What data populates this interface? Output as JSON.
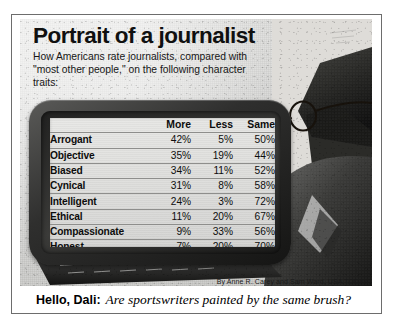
{
  "graphic": {
    "title": "Portrait of a journalist",
    "subtitle": "How Americans rate journalists, compared with \"most other people,\" on the following character traits:",
    "source": "Source: Louis Harris for the Center for Media and Public Affairs",
    "byline": "By Anne R. Carey and Sam Ward, USA TODAY"
  },
  "caption": {
    "lead": "Hello, Dali:",
    "text": "Are sportswriters painted by the same brush?"
  },
  "colors": {
    "panel_background": "#d9d9d7",
    "screen_background": "#dedede",
    "bezel_dark": "#151514",
    "text": "#0d0d0d",
    "rule": "#8e8e8c",
    "frame_border": "#6d6d6d"
  },
  "illustration": {
    "subject": "silhouette of a man in a suit wearing eyeglasses behind a computer monitor and keyboard",
    "parts": [
      "head-silhouette",
      "eyeglasses-lens",
      "eyeglasses-temple",
      "suit-shoulder",
      "keyboard"
    ]
  },
  "chart_data": {
    "type": "table",
    "title": "Portrait of a journalist",
    "subtitle": "How Americans rate journalists, compared with \"most other people,\" on the following character traits:",
    "columns": [
      "",
      "More",
      "Less",
      "Same"
    ],
    "categories": [
      "Arrogant",
      "Objective",
      "Biased",
      "Cynical",
      "Intelligent",
      "Ethical",
      "Compassionate",
      "Honest"
    ],
    "series": [
      {
        "name": "More",
        "values": [
          42,
          35,
          34,
          31,
          24,
          11,
          9,
          7
        ],
        "unit": "%"
      },
      {
        "name": "Less",
        "values": [
          5,
          19,
          11,
          8,
          3,
          20,
          33,
          20
        ],
        "unit": "%"
      },
      {
        "name": "Same",
        "values": [
          50,
          44,
          52,
          58,
          72,
          67,
          56,
          70
        ],
        "unit": "%"
      }
    ],
    "rows": [
      {
        "trait": "Arrogant",
        "more": "42%",
        "less": "5%",
        "same": "50%"
      },
      {
        "trait": "Objective",
        "more": "35%",
        "less": "19%",
        "same": "44%"
      },
      {
        "trait": "Biased",
        "more": "34%",
        "less": "11%",
        "same": "52%"
      },
      {
        "trait": "Cynical",
        "more": "31%",
        "less": "8%",
        "same": "58%"
      },
      {
        "trait": "Intelligent",
        "more": "24%",
        "less": "3%",
        "same": "72%"
      },
      {
        "trait": "Ethical",
        "more": "11%",
        "less": "20%",
        "same": "67%"
      },
      {
        "trait": "Compassionate",
        "more": "9%",
        "less": "33%",
        "same": "56%"
      },
      {
        "trait": "Honest",
        "more": "7%",
        "less": "20%",
        "same": "70%"
      }
    ],
    "source": "Source: Louis Harris for the Center for Media and Public Affairs",
    "xlabel": "",
    "ylabel": "",
    "grid": true,
    "legend": "none"
  }
}
